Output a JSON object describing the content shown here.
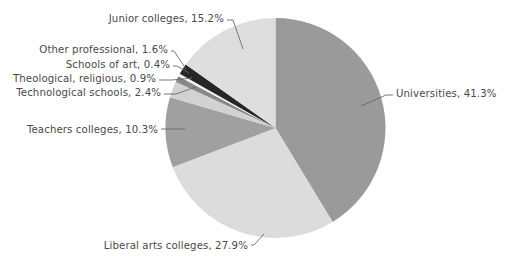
{
  "chart_data": {
    "type": "pie",
    "title": "",
    "subtitle": "",
    "xlabel": "",
    "ylabel": "",
    "legend_position": "none",
    "grid": false,
    "label_format": "{name}, {value}%",
    "start_angle_deg": 0,
    "direction": "clockwise",
    "categories": [
      "Universities",
      "Liberal arts colleges",
      "Teachers colleges",
      "Technological schools",
      "Theological, religious",
      "Schools of art",
      "Other professional",
      "Junior colleges"
    ],
    "values": [
      41.3,
      27.9,
      10.3,
      2.4,
      0.9,
      0.4,
      1.6,
      15.2
    ],
    "colors": [
      "#9a9a9a",
      "#dcdcdc",
      "#a0a0a0",
      "#d2d2d2",
      "#888888",
      "#f2f2f2",
      "#262626",
      "#dedede"
    ],
    "slices": [
      {
        "name": "Universities",
        "value": 41.3,
        "label": "Universities, 41.3%",
        "color": "#9a9a9a",
        "label_side": "right",
        "label_x": 396,
        "label_y": 97,
        "leader": "M 361,106 L 386,95 L 393,95"
      },
      {
        "name": "Liberal arts colleges",
        "value": 27.9,
        "label": "Liberal arts colleges, 27.9%",
        "color": "#dcdcdc",
        "label_side": "left",
        "label_x": 248,
        "label_y": 249,
        "leader": "M 264,234 L 254,245 L 251,245"
      },
      {
        "name": "Teachers colleges",
        "value": 10.3,
        "label": "Teachers colleges, 10.3%",
        "color": "#a0a0a0",
        "label_side": "left",
        "label_x": 158,
        "label_y": 133,
        "leader": "M 185,129 L 161,129"
      },
      {
        "name": "Technological schools",
        "value": 2.4,
        "label": "Technological schools, 2.4%",
        "color": "#d2d2d2",
        "label_side": "left",
        "label_x": 161,
        "label_y": 96,
        "leader": "M 196,87 L 176,94 L 164,94"
      },
      {
        "name": "Theological, religious",
        "value": 0.9,
        "label": "Theological, religious, 0.9%",
        "color": "#888888",
        "label_side": "left",
        "label_x": 156,
        "label_y": 82,
        "leader": "M 192,78 L 172,80 L 159,80"
      },
      {
        "name": "Schools of art",
        "value": 0.4,
        "label": "Schools of art, 0.4%",
        "color": "#f2f2f2",
        "label_side": "left",
        "label_x": 170,
        "label_y": 68,
        "leader": "M 189,73 L 177,66 L 173,66"
      },
      {
        "name": "Other professional",
        "value": 1.6,
        "label": "Other professional, 1.6%",
        "color": "#262626",
        "label_side": "left",
        "label_x": 168,
        "label_y": 53,
        "leader": "M 186,69 L 174,51 L 171,51"
      },
      {
        "name": "Junior colleges",
        "value": 15.2,
        "label": "Junior colleges, 15.2%",
        "color": "#dedede",
        "label_side": "left",
        "label_x": 224,
        "label_y": 22,
        "leader": "M 243,49 L 233,20 L 227,20"
      }
    ],
    "geometry": {
      "cx": 275.5,
      "cy": 128,
      "r": 110
    },
    "total": 100.0
  }
}
